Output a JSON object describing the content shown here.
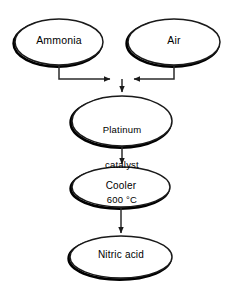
{
  "diagram": {
    "type": "process-flowchart",
    "background_color": "#ffffff",
    "stroke_color": "#1a1a1a",
    "shadow_color": "#000000",
    "nodes": [
      {
        "id": "ammonia",
        "shape": "ellipse",
        "label": "Ammonia",
        "lines": [
          "Ammonia"
        ],
        "cx": 59,
        "cy": 42,
        "rx": 44,
        "ry": 23
      },
      {
        "id": "air",
        "shape": "ellipse",
        "label": "Air",
        "lines": [
          "Air"
        ],
        "cx": 174,
        "cy": 42,
        "rx": 46,
        "ry": 23
      },
      {
        "id": "catalyst",
        "shape": "ellipse",
        "label": "Platinum catalyst 600 °C",
        "lines": [
          "Platinum",
          "catalyst",
          "600 °C"
        ],
        "cx": 122,
        "cy": 121,
        "rx": 50,
        "ry": 25
      },
      {
        "id": "cooler",
        "shape": "ellipse",
        "label": "Cooler",
        "lines": [
          "Cooler"
        ],
        "cx": 121,
        "cy": 187,
        "rx": 49,
        "ry": 20
      },
      {
        "id": "product",
        "shape": "ellipse",
        "label": "Nitric acid",
        "lines": [
          "Nitric acid"
        ],
        "cx": 121,
        "cy": 257,
        "rx": 51,
        "ry": 21
      }
    ],
    "connectors": [
      {
        "id": "ammonia-to-junction",
        "from": "ammonia",
        "to": "junction",
        "style": "elbow",
        "arrowhead": "right"
      },
      {
        "id": "air-to-junction",
        "from": "air",
        "to": "junction",
        "style": "elbow",
        "arrowhead": "left"
      },
      {
        "id": "junction-to-catalyst",
        "from": "junction",
        "to": "catalyst",
        "style": "straight",
        "arrowhead": "down"
      },
      {
        "id": "catalyst-to-cooler",
        "from": "catalyst",
        "to": "cooler",
        "style": "straight",
        "arrowhead": "down"
      },
      {
        "id": "cooler-to-product",
        "from": "cooler",
        "to": "product",
        "style": "straight",
        "arrowhead": "down"
      }
    ]
  }
}
